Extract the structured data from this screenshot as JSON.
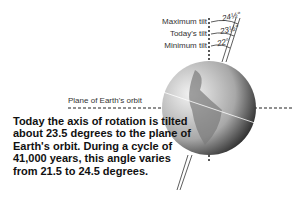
{
  "diagram": {
    "tilt_labels": [
      {
        "label": "Maximum tilt",
        "angle": "24½°"
      },
      {
        "label": "Today's tilt",
        "angle": "23½°"
      },
      {
        "label": "Minimum tilt",
        "angle": "22°"
      }
    ],
    "plane_label": "Plane of Earth's orbit",
    "caption": "Today the axis of rotation is tilted about 23.5 degrees to the plane of Earth's orbit. During a cycle of 41,000 years, this angle varies from 21.5 to 24.5 degrees.",
    "colors": {
      "globe_light": "#d8d8d8",
      "globe_dark": "#222222",
      "land": "#8a8a8a"
    }
  }
}
